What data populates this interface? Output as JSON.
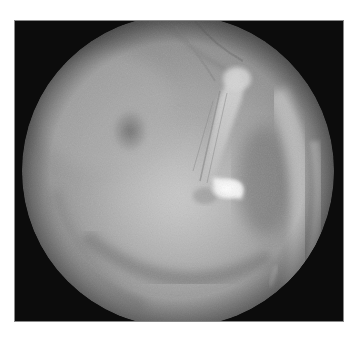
{
  "image": {
    "kind": "otoscopic view of tympanic membrane (grayscale)",
    "background_color": "#ffffff",
    "frame_color": "#0c0c0c",
    "field_of_view": {
      "shape": "circle",
      "center": [
        163,
        150
      ],
      "radius": 156,
      "base_tone": "#9a9a9a",
      "edge_tone": "#6e6e6e"
    },
    "features": [
      {
        "name": "malleus-handle",
        "tone": "#c8c8c8"
      },
      {
        "name": "short-process",
        "tone": "#d6d6d6"
      },
      {
        "name": "light-reflex",
        "tone": "#ffffff"
      },
      {
        "name": "annulus-right",
        "tone": "#bdbdbd"
      },
      {
        "name": "dark-patch-upper-left",
        "tone": "#6f6f6f"
      },
      {
        "name": "lower-annulus-arc",
        "tone": "#7d7d7d"
      }
    ]
  }
}
